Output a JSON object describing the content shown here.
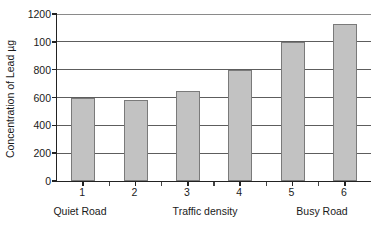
{
  "chart_data": {
    "type": "bar",
    "title": "",
    "subtitle": "",
    "xlabel": "Traffic density",
    "ylabel": "Concentration of Lead µg",
    "categories": [
      "1",
      "2",
      "3",
      "4",
      "5",
      "6"
    ],
    "values": [
      600,
      580,
      650,
      800,
      1000,
      1130
    ],
    "series": [
      {
        "name": "Concentration of Lead",
        "values": [
          600,
          580,
          650,
          800,
          1000,
          1130
        ]
      }
    ],
    "ylim": [
      0,
      1200
    ],
    "ytick_values": [
      0,
      200,
      400,
      600,
      800,
      1000,
      1200
    ],
    "ytick_labels": [
      "0",
      "200",
      "400",
      "600",
      "800",
      "100",
      "1200"
    ],
    "xtick_labels": [
      "1",
      "2",
      "3",
      "4",
      "5",
      "6"
    ],
    "grid": true,
    "grid_axis": "y",
    "legend": false,
    "legend_position": "none",
    "bar_fill_color": "#c2c2c2",
    "bar_edge_color": "#7a7a7a",
    "axis_color": "#222222",
    "gridline_color": "#5d5d5d",
    "background_color": "#ffffff",
    "annotations": [
      {
        "text": "Quiet Road",
        "position": "below-axis-left"
      },
      {
        "text": "Traffic density",
        "position": "below-axis-center"
      },
      {
        "text": "Busy Road",
        "position": "below-axis-right"
      }
    ]
  },
  "axis": {
    "y_title": "Concentration of Lead µg"
  },
  "captions": {
    "quiet_road": "Quiet Road",
    "traffic_density": "Traffic density",
    "busy_road": "Busy Road"
  }
}
